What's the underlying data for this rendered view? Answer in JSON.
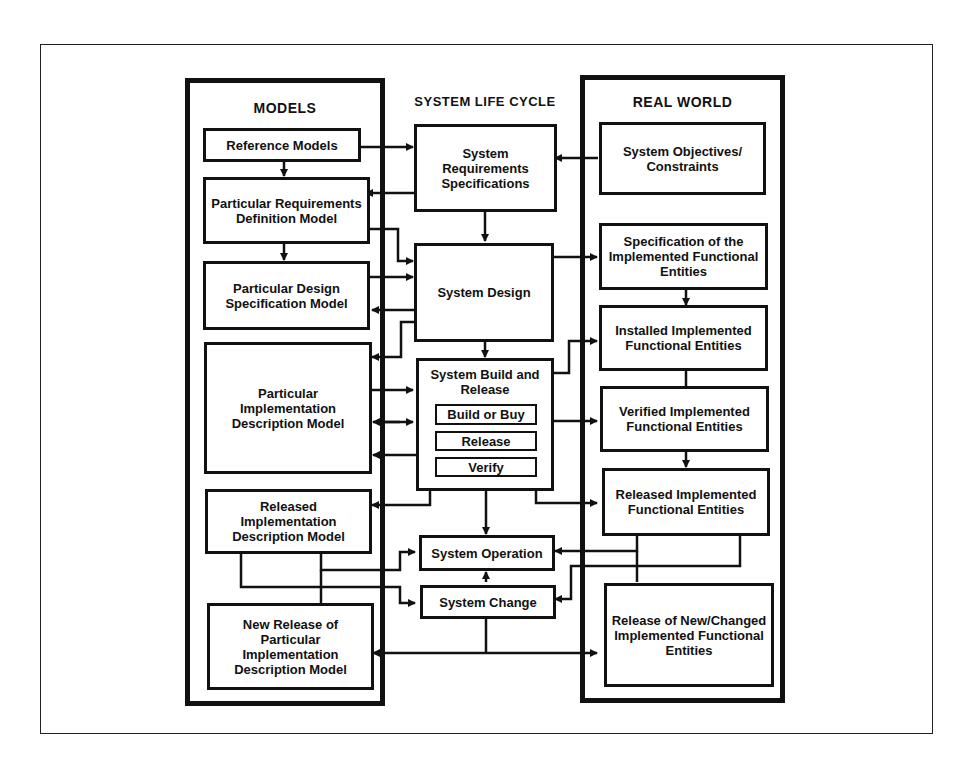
{
  "diagram": {
    "columns": {
      "models": "MODELS",
      "life_cycle": "SYSTEM LIFE CYCLE",
      "real_world": "REAL WORLD"
    },
    "models": [
      {
        "id": "reference-models",
        "label": "Reference Models"
      },
      {
        "id": "requirements-definition-model",
        "label": "Particular Requirements Definition Model"
      },
      {
        "id": "design-specification-model",
        "label": "Particular Design Specification Model"
      },
      {
        "id": "implementation-description-model",
        "label": "Particular Implementation Description Model"
      },
      {
        "id": "released-implementation-model",
        "label": "Released Implementation Description Model"
      },
      {
        "id": "new-release-model",
        "label": "New Release of Particular Implementation Description Model"
      }
    ],
    "life_cycle": [
      {
        "id": "requirements-specifications",
        "label": "System Requirements Specifications"
      },
      {
        "id": "system-design",
        "label": "System Design"
      },
      {
        "id": "build-release",
        "label": "System Build and Release",
        "steps": [
          "Build or Buy",
          "Release",
          "Verify"
        ]
      },
      {
        "id": "system-operation",
        "label": "System Operation"
      },
      {
        "id": "system-change",
        "label": "System Change"
      }
    ],
    "real_world": [
      {
        "id": "objectives-constraints",
        "label": "System Objectives/ Constraints"
      },
      {
        "id": "specification-implemented",
        "label": "Specification of the Implemented Functional Entities"
      },
      {
        "id": "installed-implemented",
        "label": "Installed Implemented Functional Entities"
      },
      {
        "id": "verified-implemented",
        "label": "Verified Implemented Functional Entities"
      },
      {
        "id": "released-implemented",
        "label": "Released Implemented Functional Entities"
      },
      {
        "id": "new-changed-implemented",
        "label": "Release of New/Changed Implemented Functional Entities"
      }
    ],
    "colors": {
      "ink": "#111111",
      "paper": "#ffffff"
    }
  }
}
